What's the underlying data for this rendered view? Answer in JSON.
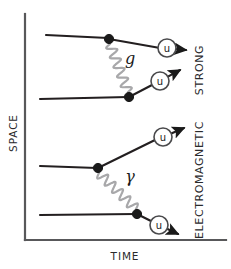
{
  "figure": {
    "width": 231,
    "height": 269,
    "background": "#ffffff"
  },
  "axes": {
    "x_label": "TIME",
    "y_label": "SPACE",
    "line_color": "#58585a",
    "origin": {
      "x": 25,
      "y": 240
    },
    "x_end": {
      "x": 226,
      "y": 240
    },
    "y_end": {
      "x": 25,
      "y": 14
    }
  },
  "panels": [
    {
      "id": "strong",
      "force_label": "STRONG",
      "boson_label": "g",
      "boson_name": "gluon",
      "boson_color": "#a8a8aa",
      "label_position": {
        "x": 199,
        "y": 70
      },
      "boson_label_position": {
        "x": 130,
        "y": 58
      },
      "incoming_particles": [
        {
          "from": {
            "x": 46,
            "y": 35
          },
          "to": {
            "x": 108,
            "y": 38
          }
        },
        {
          "from": {
            "x": 40,
            "y": 99
          },
          "to": {
            "x": 128,
            "y": 97
          }
        }
      ],
      "vertices": [
        {
          "x": 109,
          "y": 39,
          "radius": 4.6
        },
        {
          "x": 129,
          "y": 97,
          "radius": 4.6
        }
      ],
      "outgoing_particles": [
        {
          "label": "u",
          "line_from": {
            "x": 109,
            "y": 39
          },
          "line_to": {
            "x": 160,
            "y": 48
          },
          "ring": {
            "x": 167,
            "y": 48,
            "r": 9
          },
          "arrow_to": {
            "x": 186,
            "y": 50
          }
        },
        {
          "label": "u",
          "line_from": {
            "x": 129,
            "y": 97
          },
          "line_to": {
            "x": 152,
            "y": 85
          },
          "ring": {
            "x": 160,
            "y": 81,
            "r": 9
          },
          "arrow_to": {
            "x": 180,
            "y": 70
          }
        }
      ],
      "boson_wave": {
        "from": {
          "x": 110,
          "y": 44
        },
        "to": {
          "x": 128,
          "y": 92
        },
        "amplitude": 5.0,
        "periods": 5
      }
    },
    {
      "id": "electromagnetic",
      "force_label": "ELECTROMAGNETIC",
      "boson_label": "γ",
      "boson_name": "photon",
      "boson_color": "#a8a8aa",
      "label_position": {
        "x": 199,
        "y": 180
      },
      "boson_label_position": {
        "x": 130,
        "y": 176
      },
      "incoming_particles": [
        {
          "from": {
            "x": 40,
            "y": 166
          },
          "to": {
            "x": 97,
            "y": 168
          }
        },
        {
          "from": {
            "x": 40,
            "y": 215
          },
          "to": {
            "x": 136,
            "y": 214
          }
        }
      ],
      "vertices": [
        {
          "x": 98,
          "y": 168,
          "radius": 4.6
        },
        {
          "x": 137,
          "y": 214,
          "radius": 4.6
        }
      ],
      "outgoing_particles": [
        {
          "label": "u",
          "line_from": {
            "x": 98,
            "y": 168
          },
          "line_to": {
            "x": 155,
            "y": 140
          },
          "ring": {
            "x": 163,
            "y": 137,
            "r": 9
          },
          "arrow_to": {
            "x": 184,
            "y": 128
          }
        },
        {
          "label": "u",
          "line_from": {
            "x": 137,
            "y": 214
          },
          "line_to": {
            "x": 151,
            "y": 221
          },
          "ring": {
            "x": 159,
            "y": 225,
            "r": 9
          },
          "arrow_to": {
            "x": 178,
            "y": 234
          }
        }
      ],
      "boson_wave": {
        "from": {
          "x": 99,
          "y": 173
        },
        "to": {
          "x": 136,
          "y": 209
        },
        "amplitude": 5.0,
        "periods": 5
      }
    }
  ],
  "chart_data": {
    "type": "diagram",
    "xlabel": "TIME",
    "ylabel": "SPACE",
    "grid": false,
    "legend": null,
    "annotations": [
      "g",
      "γ",
      "u",
      "u",
      "u",
      "u",
      "STRONG",
      "ELECTROMAGNETIC"
    ]
  }
}
